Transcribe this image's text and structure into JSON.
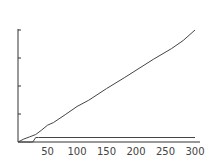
{
  "chart_data": {
    "type": "line",
    "title": "",
    "xlabel": "",
    "ylabel": "",
    "x_ticks": [
      50,
      100,
      150,
      200,
      250,
      300
    ],
    "y_ticks_count": 4,
    "xlim": [
      0,
      300
    ],
    "ylim": [
      0,
      300
    ],
    "grid": false,
    "legend": null,
    "series": [
      {
        "name": "diagonal",
        "x": [
          0,
          10,
          20,
          30,
          40,
          50,
          60,
          80,
          100,
          120,
          150,
          180,
          200,
          230,
          260,
          280,
          300
        ],
        "y": [
          0,
          8,
          14,
          20,
          32,
          45,
          52,
          73,
          95,
          112,
          143,
          172,
          192,
          222,
          250,
          272,
          300
        ]
      },
      {
        "name": "flat",
        "x": [
          0,
          25,
          30,
          35,
          300
        ],
        "y": [
          0,
          0,
          12,
          12,
          12
        ]
      }
    ]
  },
  "axis": {
    "x_labels": [
      "50",
      "100",
      "150",
      "200",
      "250",
      "300"
    ]
  }
}
